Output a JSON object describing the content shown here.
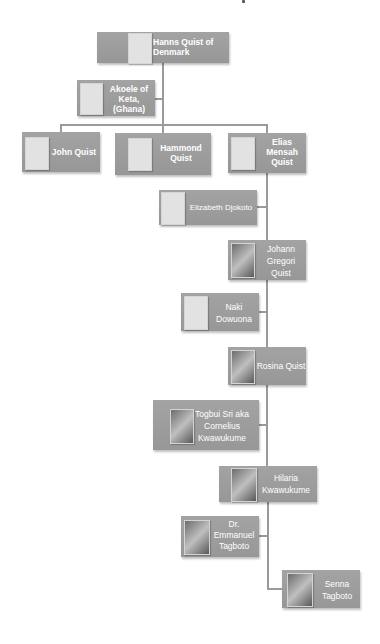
{
  "diagram": {
    "type": "family-tree",
    "colors": {
      "node_fill": "#9a9a9a",
      "connector": "#9a9a9a",
      "placeholder": "#e2e2e2",
      "text": "#ffffff",
      "background": "#ffffff"
    },
    "nodes": [
      {
        "id": "hanns",
        "label": "Hanns Quist of Denmark",
        "photo": false
      },
      {
        "id": "akoele",
        "label": "Akoele of Keta, (Ghana)",
        "photo": false
      },
      {
        "id": "john",
        "label": "John Quist",
        "photo": false
      },
      {
        "id": "hammond",
        "label": "Hammond Quist",
        "photo": false
      },
      {
        "id": "elias",
        "label": "Elias Mensah Quist",
        "photo": false
      },
      {
        "id": "elizabeth",
        "label": "Elizabeth Djokoto",
        "photo": false
      },
      {
        "id": "johann",
        "label": "Johann Gregori Quist",
        "photo": true
      },
      {
        "id": "naki",
        "label": "Naki Dowuona",
        "photo": false
      },
      {
        "id": "rosina",
        "label": "Rosina Quist",
        "photo": true
      },
      {
        "id": "togbui",
        "label": "Togbui Sri aka Cornelius Kwawukume",
        "photo": true
      },
      {
        "id": "hilaria",
        "label": "Hilaria Kwawukume",
        "photo": true
      },
      {
        "id": "emmanuel",
        "label": "Dr. Emmanuel Tagboto",
        "photo": true
      },
      {
        "id": "senna",
        "label": "Senna Tagboto",
        "photo": true
      }
    ],
    "labels": {
      "hanns": "Hanns Quist of Denmark",
      "akoele": "Akoele of Keta, (Ghana)",
      "john": "John Quist",
      "hammond": "Hammond Quist",
      "elias": "Elias Mensah Quist",
      "elizabeth": "Elizabeth Djokoto",
      "johann": "Johann Gregori Quist",
      "naki": "Naki Dowuona",
      "rosina": "Rosina Quist",
      "togbui": "Togbui Sri aka Cornelius Kwawukume",
      "hilaria": "Hilaria Kwawukume",
      "emmanuel": "Dr. Emmanuel Tagboto",
      "senna": "Senna Tagboto"
    },
    "edges": [
      {
        "from": "hanns",
        "to": "akoele",
        "kind": "spouse"
      },
      {
        "from": "hanns",
        "to": "john",
        "kind": "child"
      },
      {
        "from": "hanns",
        "to": "hammond",
        "kind": "child"
      },
      {
        "from": "hanns",
        "to": "elias",
        "kind": "child"
      },
      {
        "from": "elias",
        "to": "elizabeth",
        "kind": "spouse"
      },
      {
        "from": "elias",
        "to": "johann",
        "kind": "child"
      },
      {
        "from": "johann",
        "to": "naki",
        "kind": "spouse"
      },
      {
        "from": "johann",
        "to": "rosina",
        "kind": "child"
      },
      {
        "from": "rosina",
        "to": "togbui",
        "kind": "spouse"
      },
      {
        "from": "rosina",
        "to": "hilaria",
        "kind": "child"
      },
      {
        "from": "hilaria",
        "to": "emmanuel",
        "kind": "spouse"
      },
      {
        "from": "hilaria",
        "to": "senna",
        "kind": "child"
      }
    ]
  }
}
